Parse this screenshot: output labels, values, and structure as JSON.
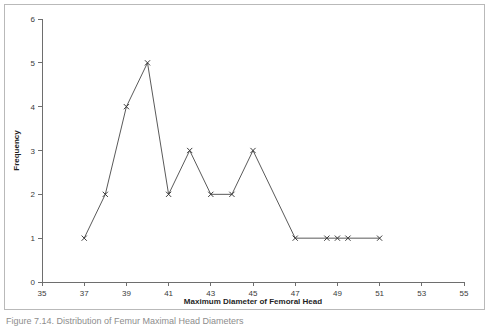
{
  "figure": {
    "caption": "Figure 7.14.  Distribution of Femur Maximal Head Diameters",
    "border_color": "#b9b9b9",
    "background_color": "#ffffff"
  },
  "chart_data": {
    "type": "line",
    "title": "",
    "xlabel": "Maximum Diameter of Femoral Head",
    "ylabel": "Frequency",
    "xlim": [
      35,
      55
    ],
    "ylim": [
      0,
      6
    ],
    "grid": false,
    "legend": "none",
    "marker": "x",
    "line_color": "#5a5a5a",
    "marker_color": "#3c3c3c",
    "x_ticks": [
      35,
      37,
      39,
      41,
      43,
      45,
      47,
      49,
      51,
      53,
      55
    ],
    "y_ticks": [
      0,
      1,
      2,
      3,
      4,
      5,
      6
    ],
    "x": [
      37,
      38,
      39,
      40,
      41,
      42,
      43,
      44,
      45,
      47,
      48.5,
      49,
      49.5,
      51
    ],
    "values": [
      1,
      2,
      4,
      5,
      2,
      3,
      2,
      2,
      3,
      1,
      1,
      1,
      1,
      1
    ],
    "points": [
      {
        "x": 37,
        "y": 1
      },
      {
        "x": 38,
        "y": 2
      },
      {
        "x": 39,
        "y": 4
      },
      {
        "x": 40,
        "y": 5
      },
      {
        "x": 41,
        "y": 2
      },
      {
        "x": 42,
        "y": 3
      },
      {
        "x": 43,
        "y": 2
      },
      {
        "x": 44,
        "y": 2
      },
      {
        "x": 45,
        "y": 3
      },
      {
        "x": 47,
        "y": 1
      },
      {
        "x": 48.5,
        "y": 1
      },
      {
        "x": 49,
        "y": 1
      },
      {
        "x": 49.5,
        "y": 1
      },
      {
        "x": 51,
        "y": 1
      }
    ]
  }
}
